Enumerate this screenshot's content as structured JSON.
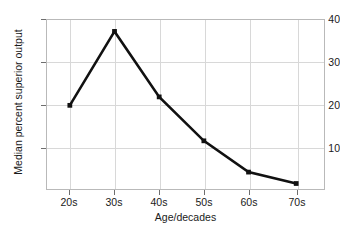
{
  "chart_data": {
    "type": "line",
    "title": "",
    "xlabel": "Age/decades",
    "ylabel": "Median percent superior output",
    "categories": [
      "20s",
      "30s",
      "40s",
      "50s",
      "60s",
      "70s"
    ],
    "values": [
      19.8,
      37.3,
      21.8,
      11.4,
      4.0,
      1.3
    ],
    "series": [
      {
        "name": "Median percent superior output",
        "values": [
          19.8,
          37.3,
          21.8,
          11.4,
          4.0,
          1.3
        ]
      }
    ],
    "ylim": [
      0,
      40
    ],
    "yticks": [
      10,
      20,
      30,
      40
    ],
    "ytick_labels": [
      "10",
      "20",
      "30",
      "40"
    ],
    "xtick_labels": [
      "20s",
      "30s",
      "40s",
      "50s",
      "60s",
      "70s"
    ],
    "grid": true,
    "legend": false,
    "legend_position": "none",
    "line_color": "#111111",
    "marker": "square",
    "grid_color": "#d8d8d8",
    "frame_color": "#b9b9b9",
    "background_color": "#ffffff"
  }
}
